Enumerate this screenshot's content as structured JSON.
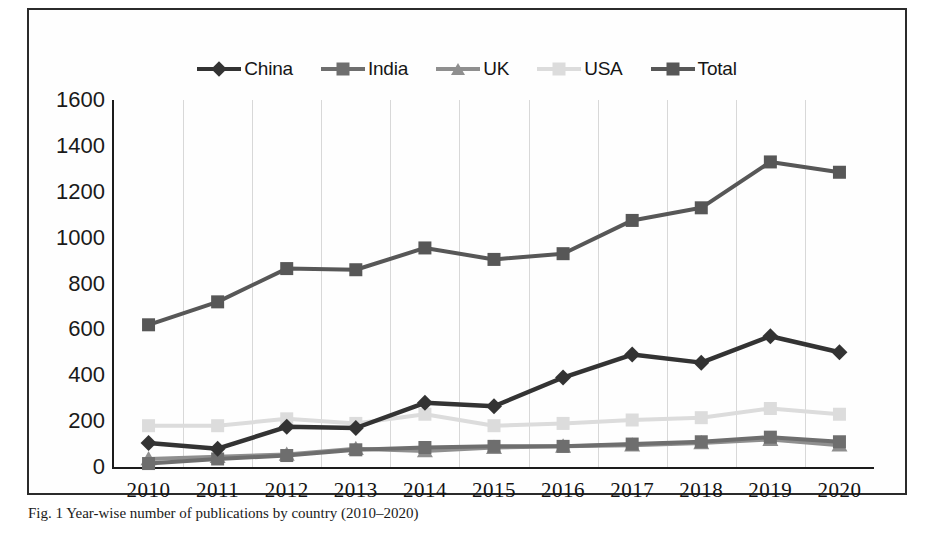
{
  "figure": {
    "caption": "Fig. 1  Year-wise number of publications by country (2010–2020)"
  },
  "legend": {
    "position": "top-center",
    "items": [
      {
        "label": "China",
        "color": "#333333",
        "marker": "diamond"
      },
      {
        "label": "India",
        "color": "#6e6e6e",
        "marker": "square"
      },
      {
        "label": "UK",
        "color": "#8f8f8f",
        "marker": "triangle"
      },
      {
        "label": "USA",
        "color": "#dcdcdc",
        "marker": "square"
      },
      {
        "label": "Total",
        "color": "#575757",
        "marker": "square"
      }
    ]
  },
  "axes": {
    "y_ticks": [
      "0",
      "200",
      "400",
      "600",
      "800",
      "1000",
      "1200",
      "1400",
      "1600"
    ],
    "x_ticks": [
      "2010",
      "2011",
      "2012",
      "2013",
      "2014",
      "2015",
      "2016",
      "2017",
      "2018",
      "2019",
      "2020"
    ]
  },
  "chart_data": {
    "type": "line",
    "title": "",
    "subtitle": "",
    "xlabel": "",
    "ylabel": "",
    "xlim": [
      2010,
      2020
    ],
    "ylim": [
      0,
      1600
    ],
    "ytick_step": 200,
    "grid": "vertical-only",
    "legend_position": "top-center",
    "categories": [
      "2010",
      "2011",
      "2012",
      "2013",
      "2014",
      "2015",
      "2016",
      "2017",
      "2018",
      "2019",
      "2020"
    ],
    "series": [
      {
        "name": "China",
        "color": "#333333",
        "marker": "diamond",
        "values": [
          105,
          80,
          175,
          170,
          280,
          265,
          390,
          490,
          455,
          570,
          500
        ]
      },
      {
        "name": "India",
        "color": "#6e6e6e",
        "marker": "square",
        "values": [
          15,
          35,
          50,
          75,
          85,
          90,
          90,
          100,
          110,
          130,
          110
        ]
      },
      {
        "name": "UK",
        "color": "#8f8f8f",
        "marker": "triangle",
        "values": [
          35,
          45,
          55,
          80,
          70,
          85,
          90,
          95,
          105,
          120,
          95
        ]
      },
      {
        "name": "USA",
        "color": "#dcdcdc",
        "marker": "square",
        "values": [
          180,
          180,
          210,
          190,
          230,
          180,
          190,
          205,
          215,
          255,
          230
        ]
      },
      {
        "name": "Total",
        "color": "#575757",
        "marker": "square",
        "values": [
          620,
          720,
          865,
          860,
          955,
          905,
          930,
          1075,
          1130,
          1330,
          1285
        ]
      }
    ]
  }
}
